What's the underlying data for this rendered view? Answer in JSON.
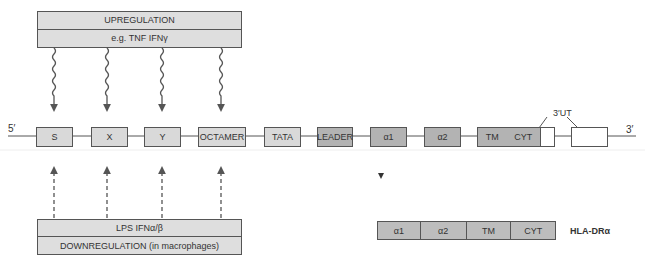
{
  "upregulation": {
    "title": "UPREGULATION",
    "examples": "e.g. TNF  IFNγ"
  },
  "downregulation": {
    "factors": "LPS  IFNα/β",
    "title": "DOWNREGULATION (in macrophages)"
  },
  "gene": {
    "five_prime": "5′",
    "three_prime": "3′",
    "utr_label": "3′UT",
    "elements": [
      {
        "label": "S"
      },
      {
        "label": "X"
      },
      {
        "label": "Y"
      },
      {
        "label": "OCTAMER"
      },
      {
        "label": "TATA"
      },
      {
        "label": "LEADER"
      },
      {
        "label": "α1"
      },
      {
        "label": "α2"
      },
      {
        "label": "TM"
      },
      {
        "label": "CYT"
      }
    ]
  },
  "protein": {
    "label": "HLA-DRα",
    "domains": [
      "α1",
      "α2",
      "TM",
      "CYT"
    ]
  }
}
